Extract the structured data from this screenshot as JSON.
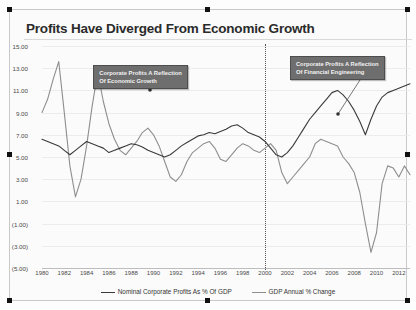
{
  "title": "Profits Have Diverged From Economic Growth",
  "callouts": [
    {
      "name": "callout-left",
      "line1": "Corporate Profits A Reflection",
      "line2": "Of Economic Growth"
    },
    {
      "name": "callout-right",
      "line1": "Corporate Profits A Reflection",
      "line2": "Of Financial Engineering"
    }
  ],
  "legend": [
    {
      "label": "Nominal Corporate Profits As % Of GDP",
      "color": "#3a3a3a"
    },
    {
      "label": "GDP Annual % Change",
      "color": "#8e8e8e"
    }
  ],
  "chart_data": {
    "type": "line",
    "title": "Profits Have Diverged From Economic Growth",
    "xlabel": "",
    "ylabel": "",
    "ylim": [
      -5,
      15
    ],
    "xlim": [
      1980,
      2013
    ],
    "grid": true,
    "legend_position": "bottom",
    "ytick_labels": [
      "15.00",
      "13.00",
      "11.00",
      "9.00",
      "7.00",
      "5.00",
      "3.00",
      "1.00",
      "(1.00)",
      "(3.00)",
      "(5.00)"
    ],
    "ytick_values": [
      15,
      13,
      11,
      9,
      7,
      5,
      3,
      1,
      -1,
      -3,
      -5
    ],
    "xtick_labels": [
      "1980",
      "1982",
      "1984",
      "1986",
      "1988",
      "1990",
      "1992",
      "1994",
      "1996",
      "1998",
      "2000",
      "2002",
      "2004",
      "2006",
      "2008",
      "2010",
      "2012"
    ],
    "xtick_values": [
      1980,
      1982,
      1984,
      1986,
      1988,
      1990,
      1992,
      1994,
      1996,
      1998,
      2000,
      2002,
      2004,
      2006,
      2008,
      2010,
      2012
    ],
    "annotations": [
      {
        "text": "Corporate Profits A Reflection Of Economic Growth",
        "x": 1988,
        "y": 12.6
      },
      {
        "text": "Corporate Profits A Reflection Of Financial Engineering",
        "x": 2006,
        "y": 13.4
      },
      {
        "text": "vertical divider at year 2000",
        "x": 2000,
        "y": null
      }
    ],
    "series": [
      {
        "name": "Nominal Corporate Profits As % Of GDP",
        "color": "#3a3a3a",
        "x": [
          1980,
          1980.5,
          1981,
          1981.5,
          1982,
          1982.5,
          1983,
          1983.5,
          1984,
          1984.5,
          1985,
          1985.5,
          1986,
          1986.5,
          1987,
          1987.5,
          1988,
          1988.5,
          1989,
          1989.5,
          1990,
          1990.5,
          1991,
          1991.5,
          1992,
          1992.5,
          1993,
          1993.5,
          1994,
          1994.5,
          1995,
          1995.5,
          1996,
          1996.5,
          1997,
          1997.5,
          1998,
          1998.5,
          1999,
          1999.5,
          2000,
          2000.5,
          2001,
          2001.5,
          2002,
          2002.5,
          2003,
          2003.5,
          2004,
          2004.5,
          2005,
          2005.5,
          2006,
          2006.5,
          2007,
          2007.5,
          2008,
          2008.5,
          2009,
          2009.5,
          2010,
          2010.5,
          2011,
          2011.5,
          2012,
          2012.5,
          2013
        ],
        "y": [
          6.6,
          6.4,
          6.2,
          6.0,
          5.6,
          5.2,
          5.6,
          6.0,
          6.4,
          6.2,
          6.0,
          5.8,
          5.4,
          5.6,
          5.8,
          6.0,
          6.2,
          6.1,
          5.9,
          5.6,
          5.4,
          5.2,
          5.0,
          5.2,
          5.6,
          6.0,
          6.3,
          6.6,
          6.9,
          7.0,
          7.2,
          7.1,
          7.3,
          7.5,
          7.8,
          7.9,
          7.6,
          7.2,
          7.0,
          6.8,
          6.4,
          5.8,
          5.2,
          5.0,
          5.4,
          6.0,
          6.8,
          7.6,
          8.4,
          9.0,
          9.6,
          10.2,
          10.8,
          11.0,
          10.6,
          10.0,
          9.2,
          8.2,
          7.0,
          8.4,
          9.6,
          10.4,
          10.8,
          11.0,
          11.2,
          11.4,
          11.6
        ]
      },
      {
        "name": "GDP Annual % Change",
        "color": "#8e8e8e",
        "x": [
          1980,
          1980.5,
          1981,
          1981.5,
          1982,
          1982.5,
          1983,
          1983.5,
          1984,
          1984.5,
          1985,
          1985.5,
          1986,
          1986.5,
          1987,
          1987.5,
          1988,
          1988.5,
          1989,
          1989.5,
          1990,
          1990.5,
          1991,
          1991.5,
          1992,
          1992.5,
          1993,
          1993.5,
          1994,
          1994.5,
          1995,
          1995.5,
          1996,
          1996.5,
          1997,
          1997.5,
          1998,
          1998.5,
          1999,
          1999.5,
          2000,
          2000.5,
          2001,
          2001.5,
          2002,
          2002.5,
          2003,
          2003.5,
          2004,
          2004.5,
          2005,
          2005.5,
          2006,
          2006.5,
          2007,
          2007.5,
          2008,
          2008.5,
          2009,
          2009.5,
          2010,
          2010.5,
          2011,
          2011.5,
          2012,
          2012.5,
          2013
        ],
        "y": [
          9.0,
          10.2,
          12.0,
          13.6,
          9.0,
          4.2,
          1.4,
          3.0,
          6.0,
          9.6,
          12.6,
          10.0,
          8.0,
          6.6,
          5.6,
          5.2,
          5.8,
          6.4,
          7.2,
          7.6,
          7.0,
          6.0,
          4.6,
          3.2,
          2.8,
          3.4,
          4.6,
          5.4,
          5.8,
          6.2,
          6.4,
          5.8,
          4.8,
          4.6,
          5.2,
          5.8,
          6.2,
          6.0,
          5.6,
          5.4,
          5.8,
          6.2,
          5.6,
          3.6,
          2.6,
          3.2,
          3.8,
          4.4,
          5.0,
          6.2,
          6.6,
          6.4,
          6.2,
          6.0,
          5.0,
          4.4,
          3.6,
          1.8,
          -1.0,
          -3.6,
          -1.8,
          2.6,
          4.2,
          4.0,
          3.2,
          4.2,
          3.4
        ]
      }
    ]
  }
}
